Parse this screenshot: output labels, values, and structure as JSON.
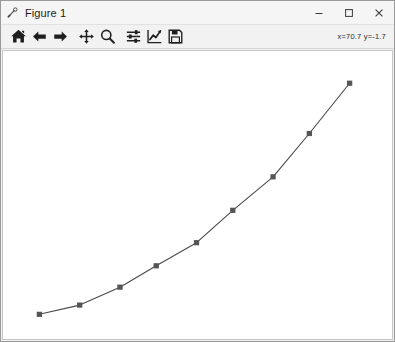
{
  "window": {
    "title": "Figure 1",
    "icon": "matplotlib-icon",
    "controls": {
      "minimize_label": "—",
      "maximize_label": "□",
      "close_label": "✕"
    }
  },
  "toolbar": {
    "buttons": [
      {
        "name": "home-icon",
        "tooltip": "Reset original view"
      },
      {
        "name": "back-arrow-icon",
        "tooltip": "Back to previous view"
      },
      {
        "name": "forward-arrow-icon",
        "tooltip": "Forward to next view"
      },
      {
        "name": "pan-move-icon",
        "tooltip": "Pan axes with left mouse, zoom with right"
      },
      {
        "name": "zoom-magnifier-icon",
        "tooltip": "Zoom to rectangle"
      },
      {
        "name": "configure-subplots-icon",
        "tooltip": "Configure subplots"
      },
      {
        "name": "edit-axis-curve-icon",
        "tooltip": "Edit axis, curve and image parameters"
      },
      {
        "name": "save-floppy-icon",
        "tooltip": "Save the figure"
      }
    ],
    "coordinate_readout": "x=70.7 y=-1.7"
  },
  "chart_data": {
    "type": "line",
    "title": "",
    "xlabel": "",
    "ylabel": "",
    "grid": false,
    "legend": false,
    "axes_visible": false,
    "xlim": [
      0,
      90
    ],
    "ylim": [
      0,
      45
    ],
    "marker": "square",
    "marker_color": "#555555",
    "line_color": "#4a4a4a",
    "line_width": 1.1,
    "series": [
      {
        "name": "series-1",
        "x": [
          5,
          15,
          25,
          34,
          44,
          53,
          63,
          72,
          82
        ],
        "y": [
          1.5,
          3.1,
          6.2,
          9.9,
          13.9,
          19.5,
          25.3,
          32.8,
          41.5
        ]
      }
    ]
  }
}
